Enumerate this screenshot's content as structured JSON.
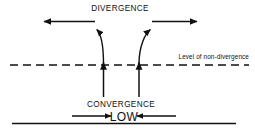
{
  "figure": {
    "type": "meteorological-schematic",
    "background_color": "#ffffff",
    "stroke_color": "#111111",
    "labels": {
      "divergence": "DIVERGENCE",
      "level_of_non_divergence": "Level of non-divergence",
      "convergence": "CONVERGENCE",
      "low": "LOW"
    },
    "elements": {
      "dashed_line_name": "level-of-non-divergence-line",
      "ground_line_name": "surface-line",
      "upper_left_arrow": "divergence-arrow-left",
      "upper_right_arrow": "divergence-arrow-right",
      "curved_left_arrow": "outflow-curve-left",
      "curved_right_arrow": "outflow-curve-right",
      "vertical_left_arrow": "ascent-arrow-left",
      "vertical_right_arrow": "ascent-arrow-right",
      "surface_left_arrow": "inflow-arrow-left",
      "surface_right_arrow": "inflow-arrow-right"
    }
  }
}
